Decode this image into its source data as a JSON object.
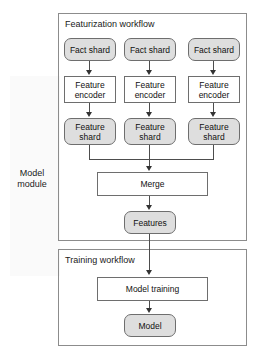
{
  "diagram": {
    "module_label": "Model\nmodule",
    "module_label_line1": "Model",
    "module_label_line2": "module",
    "containers": [
      {
        "id": "featurization",
        "title": "Featurization workflow"
      },
      {
        "id": "training",
        "title": "Training workflow"
      }
    ],
    "nodes": {
      "fact_shard_1": "Fact shard",
      "fact_shard_2": "Fact shard",
      "fact_shard_3": "Fact shard",
      "feature_encoder_1_line1": "Feature",
      "feature_encoder_1_line2": "encoder",
      "feature_encoder_2_line1": "Feature",
      "feature_encoder_2_line2": "encoder",
      "feature_encoder_3_line1": "Feature",
      "feature_encoder_3_line2": "encoder",
      "feature_shard_1_line1": "Feature",
      "feature_shard_1_line2": "shard",
      "feature_shard_2_line1": "Feature",
      "feature_shard_2_line2": "shard",
      "feature_shard_3_line1": "Feature",
      "feature_shard_3_line2": "shard",
      "merge": "Merge",
      "features": "Features",
      "model_training": "Model training",
      "model": "Model"
    },
    "colors": {
      "shaded_fill": "#dedede",
      "plain_fill": "#ffffff",
      "node_border": "#6e6e6e",
      "container_border": "#8c8c8c",
      "connector": "#4d4d4d",
      "text": "#111111",
      "background": "#ffffff"
    }
  }
}
